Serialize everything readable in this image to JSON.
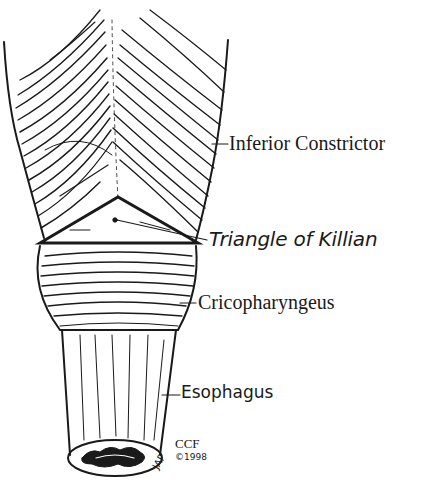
{
  "figure": {
    "style": "black ink line drawing on white background"
  },
  "labels": {
    "inferior_constrictor": "Inferior Constrictor",
    "triangle_of_killian": "Triangle of Killian",
    "cricopharyngeus": "Cricopharyngeus",
    "esophagus": "Esophagus"
  },
  "credit": {
    "org": "CCF",
    "copyright": "©1998",
    "artist_initials": "JAP"
  },
  "colors": {
    "ink": "#1a1a1a",
    "background": "#ffffff"
  }
}
